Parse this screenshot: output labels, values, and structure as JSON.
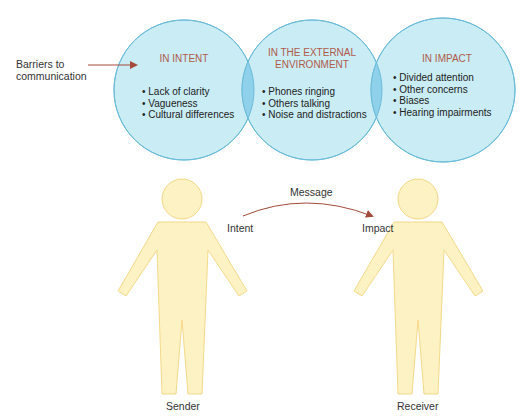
{
  "title_label": "Barriers to communication",
  "title_lines": [
    "Barriers to",
    "communication"
  ],
  "colors": {
    "circle_fill": "#c9ecf5",
    "circle_stroke": "#6bbcd8",
    "overlap_fill": "#8fd1ea",
    "heading_text": "#b05a4a",
    "arrow": "#a34a3a",
    "figure_fill": "#fdf2c4",
    "figure_stroke": "#f3d98a"
  },
  "circles": [
    {
      "heading": [
        "IN INTENT"
      ],
      "items": [
        "Lack of clarity",
        "Vagueness",
        "Cultural differences"
      ]
    },
    {
      "heading": [
        "IN THE EXTERNAL",
        "ENVIRONMENT"
      ],
      "items": [
        "Phones ringing",
        "Others talking",
        "Noise and distractions"
      ]
    },
    {
      "heading": [
        "IN IMPACT"
      ],
      "items": [
        "Divided attention",
        "Other concerns",
        "Biases",
        "Hearing impairments"
      ]
    }
  ],
  "flow": {
    "message_label": "Message",
    "intent_label": "Intent",
    "impact_label": "Impact"
  },
  "people": {
    "sender_label": "Sender",
    "receiver_label": "Receiver"
  }
}
